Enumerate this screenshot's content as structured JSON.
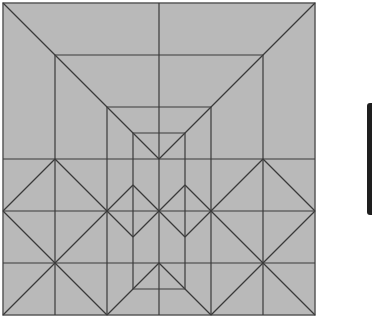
{
  "diagram": {
    "type": "crease-pattern",
    "square": {
      "x": 3,
      "y": 3,
      "size": 312
    },
    "colors": {
      "paper": "#b9b9b9",
      "line": "#3a3a3a",
      "edge": "#5a5a5a",
      "bar": "#1e1e1e"
    },
    "lines": [
      [
        3,
        3,
        159,
        159
      ],
      [
        315,
        3,
        159,
        159
      ],
      [
        159,
        3,
        159,
        315
      ],
      [
        55,
        55,
        263,
        55
      ],
      [
        55,
        55,
        55,
        315
      ],
      [
        263,
        55,
        263,
        315
      ],
      [
        107,
        107,
        211,
        107
      ],
      [
        107,
        107,
        107,
        315
      ],
      [
        211,
        107,
        211,
        315
      ],
      [
        133,
        133,
        185,
        133
      ],
      [
        133,
        133,
        133,
        289
      ],
      [
        185,
        133,
        185,
        289
      ],
      [
        133,
        289,
        185,
        289
      ],
      [
        3,
        159,
        315,
        159
      ],
      [
        3,
        211,
        315,
        211
      ],
      [
        3,
        263,
        315,
        263
      ],
      [
        55,
        159,
        107,
        211
      ],
      [
        107,
        211,
        55,
        263
      ],
      [
        55,
        263,
        3,
        211
      ],
      [
        3,
        211,
        55,
        159
      ],
      [
        263,
        159,
        315,
        211
      ],
      [
        315,
        211,
        263,
        263
      ],
      [
        263,
        263,
        211,
        211
      ],
      [
        211,
        211,
        263,
        159
      ],
      [
        133,
        185,
        159,
        211
      ],
      [
        159,
        211,
        133,
        237
      ],
      [
        133,
        237,
        107,
        211
      ],
      [
        107,
        211,
        133,
        185
      ],
      [
        185,
        185,
        211,
        211
      ],
      [
        211,
        211,
        185,
        237
      ],
      [
        185,
        237,
        159,
        211
      ],
      [
        159,
        211,
        185,
        185
      ],
      [
        55,
        263,
        3,
        315
      ],
      [
        55,
        263,
        107,
        315
      ],
      [
        263,
        263,
        211,
        315
      ],
      [
        263,
        263,
        315,
        315
      ],
      [
        107,
        315,
        133,
        289
      ],
      [
        211,
        315,
        185,
        289
      ],
      [
        133,
        289,
        159,
        263
      ],
      [
        159,
        263,
        185,
        289
      ]
    ]
  }
}
